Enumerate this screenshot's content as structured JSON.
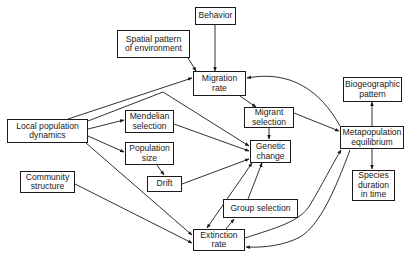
{
  "diagram": {
    "colors": {
      "stroke": "#1a1a1a",
      "background": "#ffffff"
    },
    "nodes": {
      "behavior": {
        "label": "Behavior"
      },
      "spatial": {
        "label": "Spatial pattern\nof environment"
      },
      "migration_rate": {
        "label": "Migration\nrate"
      },
      "local_pop": {
        "label": "Local population\ndynamics"
      },
      "mendelian": {
        "label": "Mendelian\nselection"
      },
      "pop_size": {
        "label": "Population\nsize"
      },
      "migrant_sel": {
        "label": "Migrant\nselection"
      },
      "genetic": {
        "label": "Genetic\nchange"
      },
      "drift": {
        "label": "Drift"
      },
      "community": {
        "label": "Community\nstructure"
      },
      "group_sel": {
        "label": "Group selection"
      },
      "extinction": {
        "label": "Extinction\nrate"
      },
      "biogeo": {
        "label": "Biogeographic\npattern"
      },
      "metapop": {
        "label": "Metapopulation\nequilibrium"
      },
      "species_dur": {
        "label": "Species\nduration\nin time"
      }
    },
    "edges": [
      {
        "from": "behavior",
        "to": "migration_rate"
      },
      {
        "from": "spatial",
        "to": "migration_rate"
      },
      {
        "from": "local_pop",
        "to": "migration_rate"
      },
      {
        "from": "local_pop",
        "to": "genetic"
      },
      {
        "from": "local_pop",
        "to": "mendelian"
      },
      {
        "from": "local_pop",
        "to": "pop_size"
      },
      {
        "from": "local_pop",
        "to": "extinction"
      },
      {
        "from": "community",
        "to": "extinction"
      },
      {
        "from": "migration_rate",
        "to": "migrant_sel"
      },
      {
        "from": "migrant_sel",
        "to": "genetic"
      },
      {
        "from": "migrant_sel",
        "to": "metapop"
      },
      {
        "from": "mendelian",
        "to": "genetic"
      },
      {
        "from": "pop_size",
        "to": "drift"
      },
      {
        "from": "drift",
        "to": "genetic"
      },
      {
        "from": "genetic",
        "to": "extinction",
        "bidirectional": true
      },
      {
        "from": "extinction",
        "to": "group_sel"
      },
      {
        "from": "group_sel",
        "to": "genetic"
      },
      {
        "from": "metapop",
        "to": "migration_rate"
      },
      {
        "from": "extinction",
        "to": "metapop"
      },
      {
        "from": "metapop",
        "to": "extinction"
      },
      {
        "from": "metapop",
        "to": "biogeo"
      },
      {
        "from": "metapop",
        "to": "species_dur"
      }
    ]
  }
}
